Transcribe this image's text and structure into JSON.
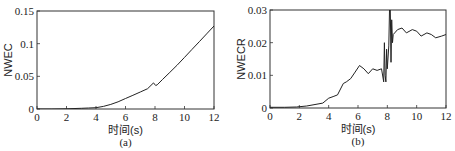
{
  "chart_data": [
    {
      "type": "line",
      "title": "",
      "caption": "(a)",
      "xlabel": "时间(s)",
      "ylabel": "NWEC",
      "xlim": [
        0,
        12
      ],
      "ylim": [
        0,
        0.15
      ],
      "xticks": [
        "0",
        "2",
        "4",
        "6",
        "8",
        "10",
        "12"
      ],
      "yticks": [
        "0",
        "0.05",
        "0.1",
        "0.15"
      ],
      "grid": false,
      "series": [
        {
          "name": "NWEC",
          "x": [
            0,
            1,
            2,
            3,
            3.5,
            4,
            4.5,
            5,
            5.5,
            6,
            6.5,
            7,
            7.5,
            7.9,
            8.05,
            8.15,
            8.5,
            9,
            9.5,
            10,
            10.5,
            11,
            11.5,
            12
          ],
          "y": [
            0,
            0,
            0.0003,
            0.001,
            0.0015,
            0.002,
            0.004,
            0.007,
            0.011,
            0.016,
            0.021,
            0.026,
            0.031,
            0.04,
            0.036,
            0.037,
            0.045,
            0.056,
            0.067,
            0.079,
            0.091,
            0.103,
            0.115,
            0.127
          ]
        }
      ]
    },
    {
      "type": "line",
      "title": "",
      "caption": "(b)",
      "xlabel": "时间(s)",
      "ylabel": "NWECR",
      "xlim": [
        0,
        12
      ],
      "ylim": [
        0,
        0.03
      ],
      "xticks": [
        "0",
        "2",
        "4",
        "6",
        "8",
        "10",
        "12"
      ],
      "yticks": [
        "0",
        "0.01",
        "0.02",
        "0.03"
      ],
      "grid": false,
      "series": [
        {
          "name": "NWECR",
          "x": [
            0,
            1,
            1.8,
            2.5,
            3,
            3.6,
            4,
            4.3,
            4.6,
            5,
            5.2,
            5.5,
            5.8,
            6.1,
            6.4,
            6.7,
            7,
            7.3,
            7.6,
            7.7,
            7.75,
            7.8,
            7.85,
            7.9,
            7.95,
            8.0,
            8.1,
            8.15,
            8.2,
            8.25,
            8.3,
            8.35,
            8.4,
            8.5,
            8.7,
            9,
            9.3,
            9.7,
            10,
            10.3,
            10.7,
            11,
            11.3,
            11.7,
            12
          ],
          "y": [
            0.0002,
            0.0002,
            0.0003,
            0.0006,
            0.001,
            0.0015,
            0.003,
            0.0035,
            0.004,
            0.0075,
            0.008,
            0.009,
            0.011,
            0.013,
            0.012,
            0.0105,
            0.012,
            0.0115,
            0.012,
            0.0095,
            0.008,
            0.02,
            0.01,
            0.008,
            0.018,
            0.012,
            0.019,
            0.03,
            0.03,
            0.014,
            0.027,
            0.02,
            0.0225,
            0.023,
            0.024,
            0.0245,
            0.023,
            0.024,
            0.0235,
            0.022,
            0.023,
            0.0225,
            0.0215,
            0.022,
            0.0225
          ]
        }
      ]
    }
  ],
  "panels": {
    "a": {
      "ylabel": "NWEC",
      "xlabel": "时间(s)",
      "caption": "(a)"
    },
    "b": {
      "ylabel": "NWECR",
      "xlabel": "时间(s)",
      "caption": "(b)"
    }
  }
}
